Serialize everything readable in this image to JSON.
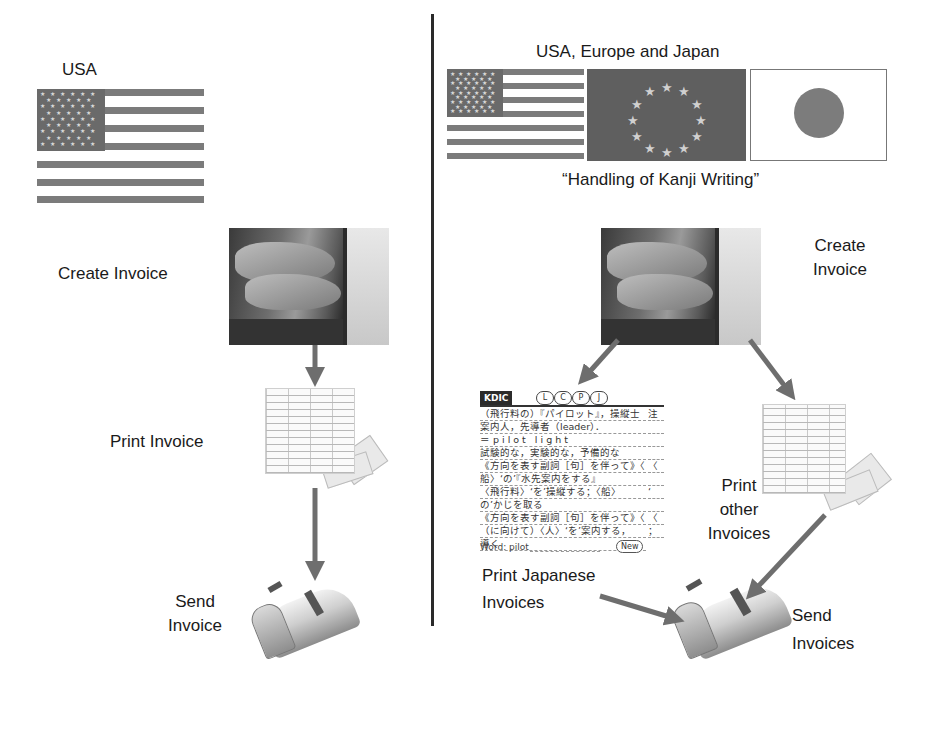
{
  "left_panel": {
    "region_label": "USA",
    "steps": [
      {
        "label": "Create Invoice"
      },
      {
        "label": "Print Invoice"
      },
      {
        "label": "Send\nInvoice",
        "line1": "Send",
        "line2": "Invoice"
      }
    ]
  },
  "right_panel": {
    "region_label": "USA, Europe and Japan",
    "subtitle": "“Handling of Kanji Writing”",
    "create": {
      "line1": "Create",
      "line2": "Invoice"
    },
    "print_japanese": {
      "line1": "Print Japanese",
      "line2": "Invoices"
    },
    "print_other": {
      "line1": "Print",
      "line2": "other",
      "line3": "Invoices"
    },
    "send": {
      "line1": "Send",
      "line2": "Invoices"
    },
    "dictionary": {
      "logo": "KDIC",
      "buttons": [
        "L",
        "C",
        "P",
        "J"
      ],
      "lines": [
        "（飛行料の）『パイロット』，操縦士",
        "案内人，先導者（leader）．",
        "＝pilot light",
        "試験的な，実験的な，予備的な",
        "《方向を表す副詞［句］を伴って》〈",
        "船〉‘の’『水先案内をする』",
        "〈飛行料〉‘を’操縦する；〈船〉",
        "の’かじを取る",
        "《方向を表す副詞［句］を伴って》〈",
        "（に向けて）〈人〉‘を’案内する，",
        "導く"
      ],
      "side_chars": [
        "注",
        "",
        "",
        "",
        "〈",
        "",
        "‘",
        "",
        "〈",
        "；",
        ""
      ],
      "word_label": "Word: pilot",
      "new_button": "New"
    }
  },
  "colors": {
    "text": "#1a1a1a",
    "arrow": "#6e6e6e",
    "divider": "#2a2a2a",
    "flag_gray": "#7b7b7b"
  }
}
